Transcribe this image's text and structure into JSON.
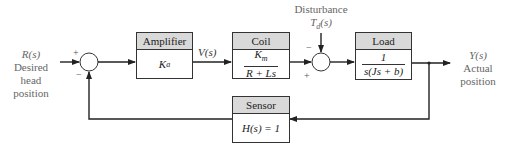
{
  "diagram": {
    "type": "block-diagram"
  },
  "input": {
    "signal": "R(s)",
    "label_line1": "Desired",
    "label_line2": "head",
    "label_line3": "position"
  },
  "output": {
    "signal": "Y(s)",
    "label_line1": "Actual",
    "label_line2": "position"
  },
  "disturbance": {
    "label": "Disturbance",
    "signal": "T_d(s)",
    "signal_main": "T",
    "signal_sub": "d",
    "signal_arg": "(s)"
  },
  "blocks": {
    "amplifier": {
      "title": "Amplifier",
      "tf_main": "K",
      "tf_sub": "a"
    },
    "coil": {
      "title": "Coil",
      "num_main": "K",
      "num_sub": "m",
      "den": "R + Ls"
    },
    "load": {
      "title": "Load",
      "num": "1",
      "den": "s(Js + b)"
    },
    "sensor": {
      "title": "Sensor",
      "tf": "H(s) = 1"
    }
  },
  "signals": {
    "amp_out": "V(s)"
  },
  "junctions": {
    "sum1": {
      "plus": "+",
      "minus": "−"
    },
    "sum2": {
      "plus": "+",
      "minus": "−"
    }
  },
  "colors": {
    "line": "#222222",
    "header_fill": "#d9d9d9",
    "label_text": "#666666"
  }
}
